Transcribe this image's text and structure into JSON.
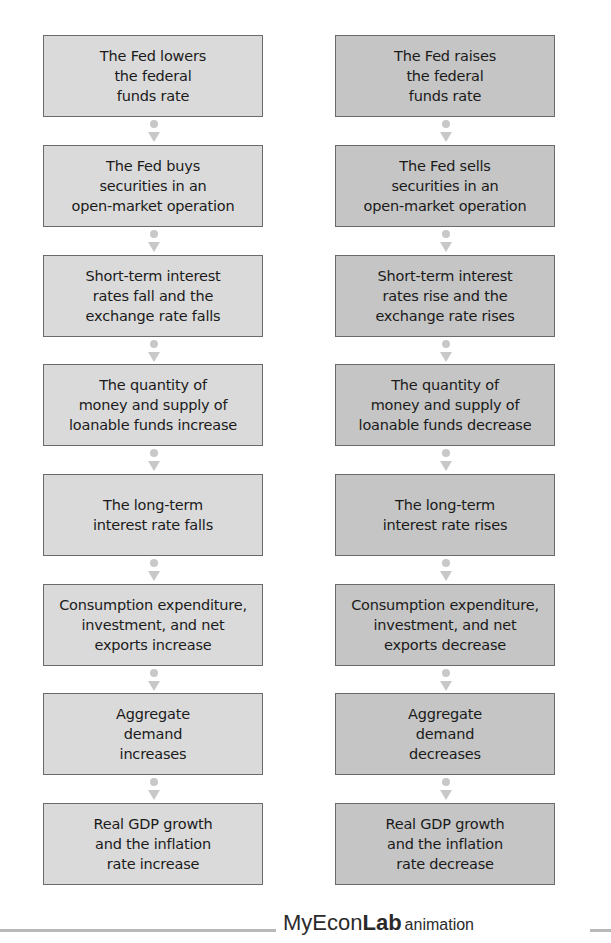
{
  "diagram": {
    "type": "parallel-flowchart",
    "columns": [
      {
        "id": "expansionary",
        "fill_color": "#dadada",
        "steps": [
          {
            "label": "The Fed lowers\nthe federal\nfunds rate"
          },
          {
            "label": "The Fed buys\nsecurities in an\nopen-market operation"
          },
          {
            "label": "Short-term interest\nrates fall and the\nexchange rate falls"
          },
          {
            "label": "The quantity of\nmoney and supply of\nloanable funds increase"
          },
          {
            "label": "The long-term\ninterest rate falls"
          },
          {
            "label": "Consumption expenditure,\ninvestment, and net\nexports increase"
          },
          {
            "label": "Aggregate\ndemand\nincreases"
          },
          {
            "label": "Real GDP growth\nand the inflation\nrate increase"
          }
        ]
      },
      {
        "id": "contractionary",
        "fill_color": "#c5c5c5",
        "steps": [
          {
            "label": "The Fed raises\nthe federal\nfunds rate"
          },
          {
            "label": "The Fed sells\nsecurities in an\nopen-market operation"
          },
          {
            "label": "Short-term interest\nrates rise and the\nexchange rate rises"
          },
          {
            "label": "The quantity of\nmoney and supply of\nloanable funds decrease"
          },
          {
            "label": "The long-term\ninterest rate rises"
          },
          {
            "label": "Consumption expenditure,\ninvestment, and net\nexports decrease"
          },
          {
            "label": "Aggregate\ndemand\ndecreases"
          },
          {
            "label": "Real GDP growth\nand the inflation\nrate decrease"
          }
        ]
      }
    ],
    "connector": {
      "icon": "down-arrow-icon",
      "color": "#c8c8c8"
    }
  },
  "footer": {
    "brand_prefix": "MyEcon",
    "brand_bold": "Lab",
    "brand_suffix": "animation",
    "rule_color": "#b8b8b8"
  }
}
